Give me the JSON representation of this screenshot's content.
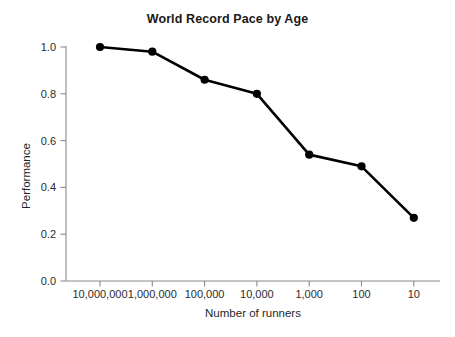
{
  "chart_data": {
    "type": "line",
    "title": "World Record Pace by Age",
    "xlabel": "Number of runners",
    "ylabel": "Performance",
    "categories": [
      "10,000,000",
      "1,000,000",
      "100,000",
      "10,000",
      "1,000",
      "100",
      "10"
    ],
    "values": [
      1.0,
      0.98,
      0.86,
      0.8,
      0.54,
      0.49,
      0.27
    ],
    "series": [
      {
        "name": "Performance",
        "values": [
          1.0,
          0.98,
          0.86,
          0.8,
          0.54,
          0.49,
          0.27
        ]
      }
    ],
    "ylim": [
      0.0,
      1.0
    ],
    "yticks": [
      0.0,
      0.2,
      0.4,
      0.6,
      0.8,
      1.0
    ],
    "ytick_labels": [
      "0.0",
      "0.2",
      "0.4",
      "0.6",
      "0.8",
      "1.0"
    ],
    "xtick_labels": [
      "10,000,000",
      "1,000,000",
      "100,000",
      "10,000",
      "1,000",
      "100",
      "10"
    ],
    "grid": false,
    "legend": false,
    "legend_position": "none",
    "marker": "circle",
    "line_color": "#000000",
    "marker_color": "#000000",
    "axis_color": "#8a8a8a",
    "background_color": "#ffffff",
    "annotations": []
  },
  "figure": {
    "title": "World Record Pace by Age",
    "x_axis_title": "Number of runners",
    "y_axis_title": "Performance"
  }
}
